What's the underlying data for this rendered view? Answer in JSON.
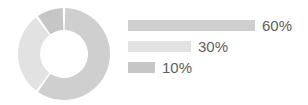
{
  "chart_data": {
    "type": "pie",
    "title": "",
    "subtitle": "",
    "xlabel": "",
    "ylabel": "",
    "variant": "donut",
    "grid": false,
    "legend_position": "right",
    "categories": [
      "Segment 1",
      "Segment 2",
      "Segment 3"
    ],
    "values": [
      60,
      30,
      10
    ],
    "labels": [
      "60%",
      "30%",
      "10%"
    ],
    "colors": [
      "#cfcfcf",
      "#e2e2e2",
      "#c6c6c6"
    ],
    "slices": [
      {
        "label": "60%",
        "value": 60,
        "color": "#cfcfcf",
        "start_angle": 0,
        "end_angle": 216
      },
      {
        "label": "30%",
        "value": 30,
        "color": "#e2e2e2",
        "start_angle": 216,
        "end_angle": 324
      },
      {
        "label": "10%",
        "value": 10,
        "color": "#c6c6c6",
        "start_angle": 324,
        "end_angle": 360
      }
    ],
    "legend_bars": [
      {
        "label": "60%",
        "value": 60,
        "color": "#cfcfcf",
        "bar_width_px": 127
      },
      {
        "label": "30%",
        "value": 30,
        "color": "#e2e2e2",
        "bar_width_px": 63
      },
      {
        "label": "10%",
        "value": 10,
        "color": "#c6c6c6",
        "bar_width_px": 27
      }
    ]
  },
  "donut": {
    "center_x": 47,
    "center_y": 47,
    "outer_radius": 46,
    "inner_radius": 24,
    "gap_color": "#ffffff"
  },
  "style": {
    "background": "#ffffff",
    "text_color": "#5e5e5e"
  }
}
